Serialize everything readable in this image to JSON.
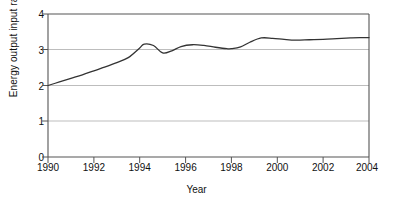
{
  "chart_data": {
    "type": "line",
    "title": "",
    "xlabel": "Year",
    "ylabel": "Energy output input ratio",
    "xlim": [
      1990,
      2004
    ],
    "ylim": [
      0,
      4
    ],
    "grid": true,
    "legend": "none",
    "xticks": [
      "1990",
      "1992",
      "1994",
      "1996",
      "1998",
      "2000",
      "2002",
      "2004"
    ],
    "xtick_values": [
      1990,
      1992,
      1994,
      1996,
      1998,
      2000,
      2002,
      2004
    ],
    "yticks": [
      "0",
      "1",
      "2",
      "3",
      "4"
    ],
    "ytick_values": [
      0,
      1,
      2,
      3,
      4
    ],
    "gridline_values": [
      1,
      2,
      3
    ],
    "line_color": "#333333",
    "axis_color": "#555555",
    "grid_color": "#bbbbbb",
    "series": [
      {
        "name": "Energy output input ratio",
        "x": [
          1990,
          1990.5,
          1991,
          1991.5,
          1992,
          1992.5,
          1993,
          1993.5,
          1994,
          1994.2,
          1994.6,
          1995,
          1995.4,
          1995.8,
          1996.3,
          1996.8,
          1997.3,
          1997.8,
          1998,
          1998.4,
          1998.8,
          1999.3,
          1999.8,
          2000.3,
          2000.8,
          2001.4,
          2002,
          2002.6,
          2003.2,
          2003.6,
          2004
        ],
        "values": [
          2.0,
          2.1,
          2.2,
          2.3,
          2.41,
          2.52,
          2.64,
          2.78,
          3.05,
          3.16,
          3.12,
          2.91,
          2.97,
          3.09,
          3.14,
          3.12,
          3.07,
          3.03,
          3.03,
          3.08,
          3.21,
          3.33,
          3.32,
          3.29,
          3.27,
          3.28,
          3.29,
          3.31,
          3.33,
          3.34,
          3.34
        ]
      }
    ]
  }
}
